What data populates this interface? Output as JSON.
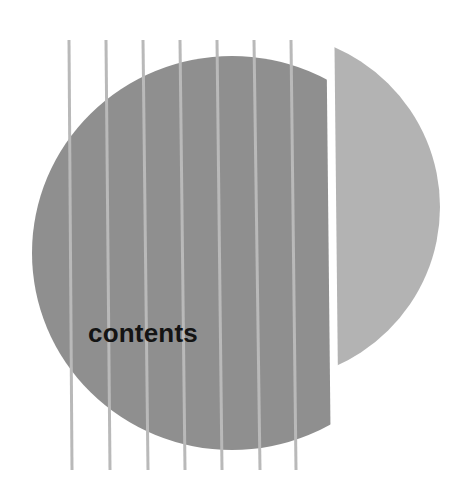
{
  "title": "contents",
  "colors": {
    "background": "#ffffff",
    "left_disc": "#8f8f8f",
    "stripes": "#b9b9b9",
    "right_segment": "#b3b3b3",
    "text": "#141414"
  },
  "shapes": {
    "left_disc": {
      "description": "striped gray disc cut vertically on its right side"
    },
    "right_segment": {
      "description": "lighter gray circular segment to the right of the cut"
    },
    "stripe_count": 7
  }
}
